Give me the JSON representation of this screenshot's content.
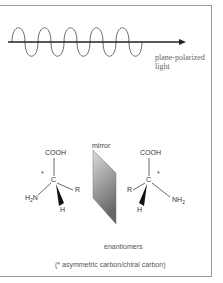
{
  "diagram": {
    "light": {
      "label_line1": "plane-polarized",
      "label_line2": "light",
      "wave_cycles": 5,
      "arrow_color": "#222222",
      "wave_color": "#666666"
    },
    "mirror": {
      "label": "mirror",
      "gradient_top": "#d8d8d8",
      "gradient_bottom": "#6a6a6a"
    },
    "molecule_left": {
      "top_group": "COOH",
      "center": "C",
      "chiral_mark": "*",
      "right_group": "R",
      "left_group_main": "H",
      "left_group_sub": "2",
      "left_group_tail": "N",
      "bottom_group": "H"
    },
    "molecule_right": {
      "top_group": "COOH",
      "center": "C",
      "chiral_mark": "*",
      "left_group": "R",
      "right_group_main": "NH",
      "right_group_sub": "2",
      "bottom_group": "H"
    },
    "caption": "enantiomers",
    "note": "(* asymmetric carbon/chiral carbon)"
  }
}
